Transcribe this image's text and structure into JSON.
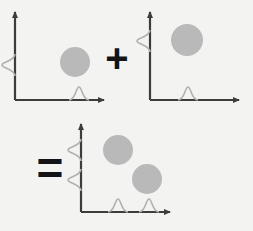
{
  "figure": {
    "background_color": "#f3f3f2",
    "axis_color": "#3c3c3c",
    "curve_color": "#b0b0b0",
    "blob_color": "#b9b9b9",
    "operator_color": "#141414"
  },
  "operators": {
    "plus": "+",
    "equals": "="
  },
  "panels": [
    {
      "id": "panel-term-1",
      "label": "first term",
      "origin": {
        "x": 15,
        "y": 100
      },
      "x_axis": {
        "length": 89,
        "arrow": true
      },
      "y_axis": {
        "length": 88,
        "arrow": true
      },
      "x_marginal": {
        "type": "gaussian",
        "peaks": [
          {
            "center": 79,
            "height": 13,
            "width": 20
          }
        ]
      },
      "y_marginal": {
        "type": "gaussian",
        "peaks": [
          {
            "center": 65,
            "height": 13,
            "width": 22
          }
        ]
      },
      "blobs": [
        {
          "cx": 75,
          "cy": 62,
          "r": 15
        }
      ]
    },
    {
      "id": "panel-term-2",
      "label": "second term",
      "origin": {
        "x": 150,
        "y": 100
      },
      "x_axis": {
        "length": 89,
        "arrow": true
      },
      "y_axis": {
        "length": 88,
        "arrow": true
      },
      "x_marginal": {
        "type": "gaussian",
        "peaks": [
          {
            "center": 188,
            "height": 13,
            "width": 20
          }
        ]
      },
      "y_marginal": {
        "type": "gaussian",
        "peaks": [
          {
            "center": 41,
            "height": 13,
            "width": 22
          }
        ]
      },
      "blobs": [
        {
          "cx": 187,
          "cy": 40,
          "r": 16
        }
      ]
    },
    {
      "id": "panel-sum",
      "label": "sum",
      "origin": {
        "x": 81,
        "y": 212
      },
      "x_axis": {
        "length": 89,
        "arrow": true
      },
      "y_axis": {
        "length": 88,
        "arrow": true
      },
      "x_marginal": {
        "type": "gaussian",
        "peaks": [
          {
            "center": 118,
            "height": 13,
            "width": 20
          },
          {
            "center": 149,
            "height": 13,
            "width": 20
          }
        ]
      },
      "y_marginal": {
        "type": "gaussian",
        "peaks": [
          {
            "center": 150,
            "height": 13,
            "width": 22
          },
          {
            "center": 180,
            "height": 13,
            "width": 22
          }
        ]
      },
      "blobs": [
        {
          "cx": 118,
          "cy": 150,
          "r": 15
        },
        {
          "cx": 147,
          "cy": 179,
          "r": 15
        }
      ]
    }
  ]
}
